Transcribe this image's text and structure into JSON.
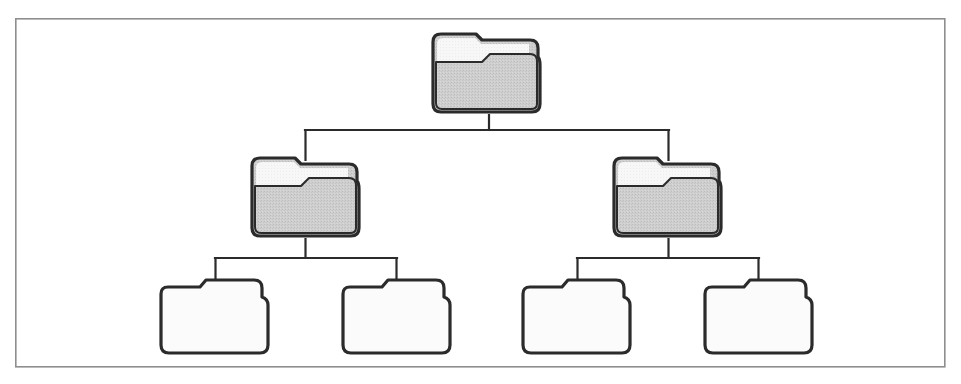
{
  "figure": {
    "kind": "folder-hierarchy-tree-diagram",
    "title": "",
    "caption": "",
    "background_color": "#ffffff",
    "frame": {
      "name": "diagram-border",
      "x": 15,
      "y": 18,
      "width": 930,
      "height": 349,
      "stroke_color": "#8e8e8e",
      "stroke_width": 1.6,
      "fill": "#ffffff"
    },
    "palette": {
      "outline": "#2b2b2b",
      "folder_gray_fill": "#c9c9c9",
      "folder_gray_paper": "#f5f5f5",
      "folder_white_fill": "#fbfbfb",
      "connector": "#2b2b2b",
      "frame": "#8e8e8e"
    },
    "stroke_widths": {
      "folder_outline": 3.2,
      "folder_inner_fold": 2.0,
      "connector": 2.2
    }
  },
  "tree": {
    "levels": 3,
    "node_count": 7,
    "root_id": "root",
    "edges": [
      {
        "id": "edge-root-branch-left",
        "from": "root",
        "to": "branch-left"
      },
      {
        "id": "edge-root-branch-right",
        "from": "root",
        "to": "branch-right"
      },
      {
        "id": "edge-branch-left-leaf-1",
        "from": "branch-left",
        "to": "leaf-1"
      },
      {
        "id": "edge-branch-left-leaf-2",
        "from": "branch-left",
        "to": "leaf-2"
      },
      {
        "id": "edge-branch-right-leaf-3",
        "from": "branch-right",
        "to": "leaf-3"
      },
      {
        "id": "edge-branch-right-leaf-4",
        "from": "branch-right",
        "to": "leaf-4"
      }
    ],
    "nodes": [
      {
        "id": "root",
        "name": "folder-node-root",
        "label": "",
        "level": 0,
        "style": "gray",
        "icon": "folder-icon",
        "x": 430,
        "y": 31,
        "width": 113,
        "height": 84
      },
      {
        "id": "branch-left",
        "name": "folder-node-branch-left",
        "label": "",
        "level": 1,
        "style": "gray",
        "icon": "folder-icon",
        "x": 249,
        "y": 155,
        "width": 113,
        "height": 84
      },
      {
        "id": "branch-right",
        "name": "folder-node-branch-right",
        "label": "",
        "level": 1,
        "style": "gray",
        "icon": "folder-icon",
        "x": 611,
        "y": 155,
        "width": 113,
        "height": 84
      },
      {
        "id": "leaf-1",
        "name": "folder-node-leaf-1",
        "label": "",
        "level": 2,
        "style": "white",
        "icon": "folder-icon",
        "x": 158,
        "y": 275,
        "width": 113,
        "height": 79
      },
      {
        "id": "leaf-2",
        "name": "folder-node-leaf-2",
        "label": "",
        "level": 2,
        "style": "white",
        "icon": "folder-icon",
        "x": 340,
        "y": 275,
        "width": 113,
        "height": 79
      },
      {
        "id": "leaf-3",
        "name": "folder-node-leaf-3",
        "label": "",
        "level": 2,
        "style": "white",
        "icon": "folder-icon",
        "x": 520,
        "y": 275,
        "width": 113,
        "height": 79
      },
      {
        "id": "leaf-4",
        "name": "folder-node-leaf-4",
        "label": "",
        "level": 2,
        "style": "white",
        "icon": "folder-icon",
        "x": 702,
        "y": 275,
        "width": 113,
        "height": 79
      }
    ],
    "connector_paths": {
      "root_to_branches": "M 489 115 L 489 130 M 306 130 L 669 130 M 306 130 L 306 158 M 669 130 L 669 158",
      "left_branch_to_leaves": "M 306 239 L 306 258 M 215 258 L 397 258 M 215 258 L 215 280 M 397 258 L 397 280",
      "right_branch_to_leaves": "M 669 239 L 669 258 M 577 258 L 759 258 M 577 258 L 577 280 M 759 258 L 759 280"
    }
  },
  "shapes": {
    "gray_folder": {
      "body_path": "M 3 11 Q 3 3 11 3 L 46 3 L 52 9 L 100 9 Q 108 9 108 17 L 108 26 Q 110 28 110 34 L 110 73 Q 110 81 102 81 L 11 81 Q 3 81 3 73 Z",
      "paper_path": "M 6 13 Q 6 6 13 6 L 44 6 L 50 12 L 100 12 L 100 22 L 60 22 L 52 30 L 6 30 Z",
      "fold_path": "M 6 30 L 52 30 L 60 22 L 100 22 Q 107 22 107 29 L 107 73 Q 107 78 101 78 L 12 78 Q 6 78 6 72 Z"
    },
    "white_folder": {
      "body_path": "M 3 17 Q 3 10 10 10 L 42 10 L 48 3 L 96 3 Q 104 3 104 11 L 104 20 Q 110 22 110 28 L 110 68 Q 110 76 102 76 L 11 76 Q 3 76 3 68 Z"
    }
  }
}
